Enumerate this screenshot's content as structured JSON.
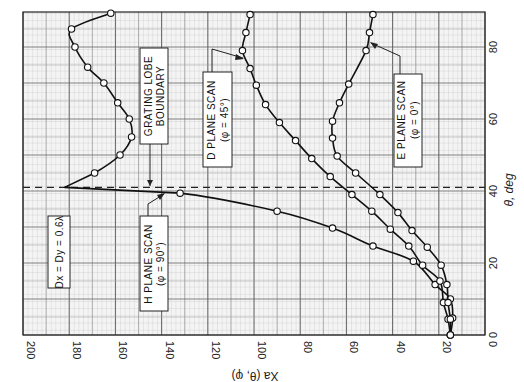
{
  "chart_data": {
    "type": "line",
    "title": "",
    "orientation_note": "Figure rotated 90 deg: horizontal axis is X_a(theta,phi) decreasing left-to-right, vertical right axis is theta in degrees",
    "xlabel": "X_a (θ, φ)",
    "ylabel": "θ, deg",
    "xlim": [
      200,
      0
    ],
    "ylim": [
      0,
      90
    ],
    "x_ticks": [
      200,
      180,
      160,
      140,
      120,
      100,
      80,
      60,
      40,
      20,
      0
    ],
    "y_ticks": [
      0,
      20,
      40,
      60,
      80
    ],
    "grid": true,
    "series": [
      {
        "name": "H PLANE SCAN (φ = 90°)",
        "points": [
          [
            15,
            0
          ],
          [
            14,
            4.7
          ],
          [
            15,
            10
          ],
          [
            21.6,
            14
          ],
          [
            31,
            20.5
          ],
          [
            48.5,
            24.7
          ],
          [
            66,
            29.7
          ],
          [
            90,
            34.4
          ],
          [
            132,
            39.4
          ],
          [
            182,
            41
          ],
          [
            169,
            45
          ],
          [
            158,
            50
          ],
          [
            153,
            55
          ],
          [
            154,
            60
          ],
          [
            159,
            64.5
          ],
          [
            165,
            70
          ],
          [
            172,
            74.4
          ],
          [
            177.5,
            80
          ],
          [
            179,
            85
          ],
          [
            162,
            89.4
          ]
        ]
      },
      {
        "name": "D PLANE SCAN (φ = 45°)",
        "points": [
          [
            15,
            0
          ],
          [
            16,
            4.4
          ],
          [
            18,
            9
          ],
          [
            19.5,
            15
          ],
          [
            27,
            19.4
          ],
          [
            33,
            24.7
          ],
          [
            41,
            29.4
          ],
          [
            49,
            34.4
          ],
          [
            57.6,
            39
          ],
          [
            67,
            44
          ],
          [
            75,
            49
          ],
          [
            82,
            54
          ],
          [
            89,
            59
          ],
          [
            95,
            64
          ],
          [
            99,
            69.4
          ],
          [
            101.7,
            74
          ],
          [
            105,
            79
          ],
          [
            103.5,
            84
          ],
          [
            101.7,
            89
          ]
        ]
      },
      {
        "name": "E PLANE SCAN (φ = 0°)",
        "points": [
          [
            15,
            0
          ],
          [
            15,
            4.4
          ],
          [
            16,
            9
          ],
          [
            16.5,
            14
          ],
          [
            19,
            19.4
          ],
          [
            25,
            24.4
          ],
          [
            31.6,
            29
          ],
          [
            37.7,
            34
          ],
          [
            45.5,
            39
          ],
          [
            56,
            45
          ],
          [
            64,
            49.7
          ],
          [
            66,
            54.7
          ],
          [
            66,
            59.4
          ],
          [
            63,
            64.5
          ],
          [
            59,
            69.7
          ],
          [
            51.5,
            79
          ],
          [
            50,
            84
          ],
          [
            48.5,
            89
          ]
        ]
      }
    ],
    "annotations": [
      {
        "text": "GRATING LOBE BOUNDARY",
        "theta": 41
      },
      {
        "text": "Dx = Dy = 0.6λ"
      }
    ]
  },
  "labels": {
    "x_axis_title": "Xa (θ, φ)",
    "y_axis_title": "θ, deg",
    "x_ticks": [
      "200",
      "180",
      "160",
      "140",
      "120",
      "100",
      "80",
      "60",
      "40",
      "20",
      "0"
    ],
    "y_ticks": [
      "0",
      "20",
      "40",
      "60",
      "80"
    ],
    "grating_line1": "GRATING LOBE",
    "grating_line2": "BOUNDARY",
    "h_line1": "H PLANE SCAN",
    "h_line2": "(φ = 90°)",
    "d_line1": "D PLANE SCAN",
    "d_line2": "(φ = 45°)",
    "e_line1": "E PLANE SCAN",
    "e_line2": "(φ = 0°)",
    "spacing": "Dx = Dy = 0.6λ"
  }
}
